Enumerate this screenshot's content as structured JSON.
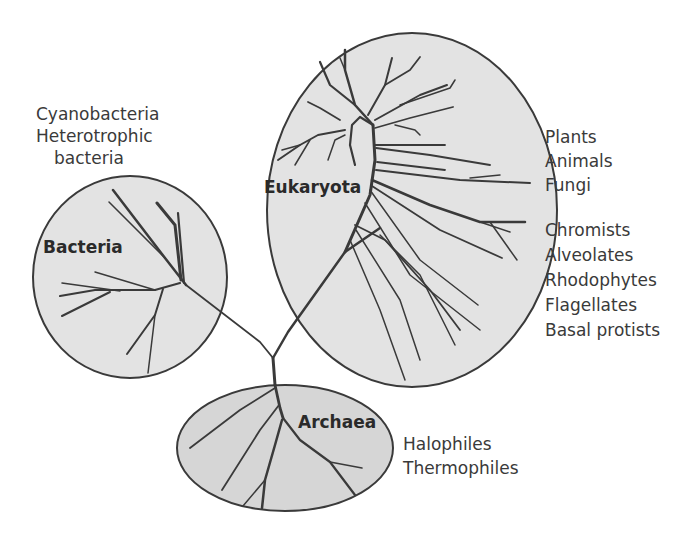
{
  "colors": {
    "ellipse_fill": "#e3e3e3",
    "archaea_fill": "#d6d6d6",
    "outline": "#3a3a3a",
    "branch": "#3a3a3a",
    "text": "#3a3a3a"
  },
  "domains": {
    "bacteria": {
      "label": "Bacteria",
      "groups": [
        "Cyanobacteria",
        "Heterotrophic",
        "bacteria"
      ]
    },
    "eukaryota": {
      "label": "Eukaryota",
      "groups_upper": [
        "Plants",
        "Animals",
        "Fungi"
      ],
      "groups_lower": [
        "Chromists",
        "Alveolates",
        "Rhodophytes",
        "Flagellates",
        "Basal protists"
      ]
    },
    "archaea": {
      "label": "Archaea",
      "groups": [
        "Halophiles",
        "Thermophiles"
      ]
    }
  }
}
